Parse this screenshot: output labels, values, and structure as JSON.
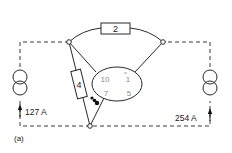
{
  "diagram": {
    "type": "circuit",
    "caption": "(a)",
    "resistors": [
      {
        "id": "r-top",
        "label": "2"
      },
      {
        "id": "r-left",
        "label": "4"
      }
    ],
    "sources": [
      {
        "id": "source-left",
        "current": "127 A"
      },
      {
        "id": "source-right",
        "current": "254 A"
      }
    ],
    "ellipse_labels": {
      "top_left": "10",
      "top_right": "1",
      "bottom_left": "7",
      "bottom_right": "5"
    },
    "colors": {
      "line": "#2a2a2a",
      "dashed": "#3a3a3a",
      "ellipse_text": "#8a8a8a"
    }
  }
}
